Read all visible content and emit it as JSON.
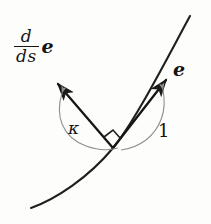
{
  "figure": {
    "kind": "differential-geometry-diagram",
    "background_color": "#fdfdfc",
    "ink_color": "#141414",
    "width": 211,
    "height": 224
  },
  "labels": {
    "derivative_fraction": {
      "numerator": "d",
      "denominator": "ds",
      "vector": "e",
      "full": "d/ds e"
    },
    "tangent_vector": "e",
    "curvature_symbol": "κ",
    "unit_length": "1"
  },
  "geometry": {
    "vertex": {
      "x": 113,
      "y": 148
    },
    "curve": {
      "description": "upward-curving arc from lower-left to upper-right",
      "path": "M 34,206 C 62,194 92,174 113,148 C 134,122 163,66 189,18"
    },
    "tangent_arrow": {
      "from": {
        "x": 113,
        "y": 148
      },
      "to": {
        "x": 167,
        "y": 79
      },
      "label": "e",
      "length_label": "1"
    },
    "derivative_arrow": {
      "from": {
        "x": 113,
        "y": 148
      },
      "to": {
        "x": 57,
        "y": 82
      },
      "label": "d/ds e",
      "length_label": "κ"
    },
    "right_angle_marker": {
      "at": {
        "x": 113,
        "y": 148
      },
      "size": 15
    },
    "arc_kappa": {
      "description": "thin arc spanning from derivative arrowhead down past kappa to the vertex region"
    },
    "arc_one": {
      "description": "thin arc spanning from tangent arrowhead down past 1 to the vertex region"
    }
  }
}
